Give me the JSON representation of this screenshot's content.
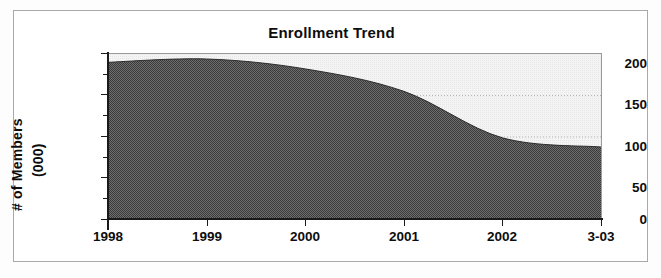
{
  "chart_data": {
    "type": "area",
    "title": "Enrollment Trend",
    "xlabel": "",
    "ylabel": "# of Members (000)",
    "ylabel_line1": "# of Members",
    "ylabel_line2": "(000)",
    "categories": [
      "1998",
      "1999",
      "2000",
      "2001",
      "2002",
      "3-03"
    ],
    "x_tick_labels": [
      "1998",
      "1999",
      "2000",
      "2001",
      "2002",
      "3-03"
    ],
    "y_tick_labels": [
      "0",
      "50",
      "100",
      "150",
      "200"
    ],
    "y_tick_values": [
      0,
      50,
      100,
      150,
      200
    ],
    "ylim": [
      0,
      200
    ],
    "grid": "horizontal-dotted",
    "gridline_values": [
      100,
      150
    ],
    "legend": "none",
    "series": [
      {
        "name": "Members",
        "values": [
          190,
          194,
          182,
          155,
          99,
          88
        ]
      }
    ],
    "points": [
      {
        "x": "1998",
        "y": 190
      },
      {
        "x": "1999",
        "y": 194
      },
      {
        "x": "2000",
        "y": 182
      },
      {
        "x": "2001",
        "y": 155
      },
      {
        "x": "2002",
        "y": 99
      },
      {
        "x": "3-03",
        "y": 88
      }
    ],
    "colors": {
      "area_fill": "#585858",
      "plot_background": "#f2f2f2",
      "axis": "#1a1a1a",
      "gridline": "#bdbdbd",
      "frame_border": "#a9a9a9",
      "text": "#0d0d0d"
    }
  }
}
